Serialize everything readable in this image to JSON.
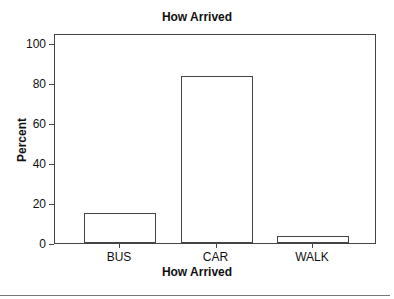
{
  "chart_data": {
    "type": "bar",
    "title": "How Arrived",
    "xlabel": "How Arrived",
    "ylabel": "Percent",
    "categories": [
      "BUS",
      "CAR",
      "WALK"
    ],
    "values": [
      14.8,
      83.6,
      3.6
    ],
    "ylim": [
      0,
      105
    ],
    "yticks": [
      0,
      20,
      40,
      60,
      80,
      100
    ],
    "grid": false,
    "legend": null
  }
}
